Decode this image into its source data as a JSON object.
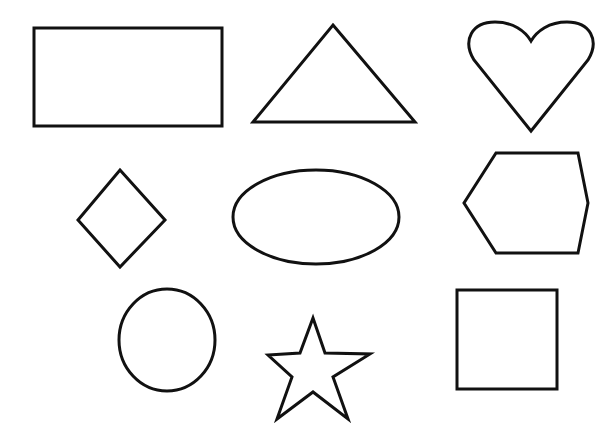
{
  "page": {
    "background_color": "#ffffff",
    "stroke_color": "#111111",
    "canvas_width": 616,
    "canvas_height": 438,
    "shape_count": 9,
    "grid_rows": 3,
    "grid_columns": 3
  },
  "shapes": [
    {
      "id": "rectangle",
      "name": "Rectangle",
      "row": 1,
      "column": 1,
      "stroke_width": 3,
      "geometry": {
        "x": 34,
        "y": 28,
        "width": 188,
        "height": 98
      }
    },
    {
      "id": "triangle",
      "name": "Triangle",
      "row": 1,
      "column": 2,
      "stroke_width": 3,
      "geometry": {
        "points": "333,25 415,122 253,122"
      }
    },
    {
      "id": "heart",
      "name": "Heart",
      "row": 1,
      "column": 3,
      "stroke_width": 3,
      "geometry": {
        "path": "M 531,131 L 474,60 C 462,40 472,22 495,22 C 513,22 525,31 531,41 C 537,31 549,22 567,22 C 590,22 600,40 588,60 Z"
      }
    },
    {
      "id": "diamond",
      "name": "Diamond",
      "row": 2,
      "column": 1,
      "stroke_width": 3,
      "geometry": {
        "points": "120,170 165,220 120,267 78,220"
      }
    },
    {
      "id": "ellipse",
      "name": "Ellipse",
      "row": 2,
      "column": 2,
      "stroke_width": 3,
      "geometry": {
        "cx": 316,
        "cy": 217,
        "rx": 83,
        "ry": 47
      }
    },
    {
      "id": "hexagon",
      "name": "Hexagon",
      "row": 2,
      "column": 3,
      "stroke_width": 3,
      "geometry": {
        "points": "496,153 578,153 588,203 578,253 496,253 464,203"
      }
    },
    {
      "id": "circle",
      "name": "Circle",
      "row": 3,
      "column": 1,
      "stroke_width": 3,
      "geometry": {
        "cx": 167,
        "cy": 340,
        "rx": 48,
        "ry": 51
      }
    },
    {
      "id": "star",
      "name": "Five-pointed Star",
      "row": 3,
      "column": 2,
      "stroke_width": 3,
      "geometry": {
        "points": "313,318 325,353 370,354 333,377 348,419 313,392 277,419 292,377 268,355 300,353"
      }
    },
    {
      "id": "square",
      "name": "Square",
      "row": 3,
      "column": 3,
      "stroke_width": 3,
      "geometry": {
        "x": 457,
        "y": 290,
        "width": 100,
        "height": 99
      }
    }
  ]
}
